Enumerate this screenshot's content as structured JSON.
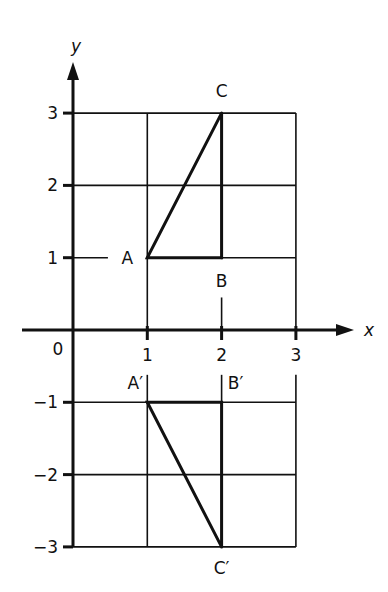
{
  "chart_data": {
    "type": "line",
    "title": "",
    "xlabel": "x",
    "ylabel": "y",
    "origin_label": "0",
    "xlim": [
      0,
      3
    ],
    "ylim": [
      -3,
      3
    ],
    "grid": true,
    "x_ticks": [
      {
        "value": 1,
        "label": "1"
      },
      {
        "value": 2,
        "label": "2"
      },
      {
        "value": 3,
        "label": "3"
      }
    ],
    "y_ticks": [
      {
        "value": 3,
        "label": "3"
      },
      {
        "value": 2,
        "label": "2"
      },
      {
        "value": 1,
        "label": "1"
      },
      {
        "value": -1,
        "label": "−1"
      },
      {
        "value": -2,
        "label": "−2"
      },
      {
        "value": -3,
        "label": "−3"
      }
    ],
    "series": [
      {
        "name": "Triangle ABC",
        "points": [
          {
            "label": "A",
            "x": 1,
            "y": 1
          },
          {
            "label": "B",
            "x": 2,
            "y": 1
          },
          {
            "label": "C",
            "x": 2,
            "y": 3
          }
        ]
      },
      {
        "name": "Triangle A'B'C' (reflection in x-axis)",
        "points": [
          {
            "label": "A′",
            "x": 1,
            "y": -1
          },
          {
            "label": "B′",
            "x": 2,
            "y": -1
          },
          {
            "label": "C′",
            "x": 2,
            "y": -3
          }
        ]
      }
    ],
    "color": "#111111"
  }
}
